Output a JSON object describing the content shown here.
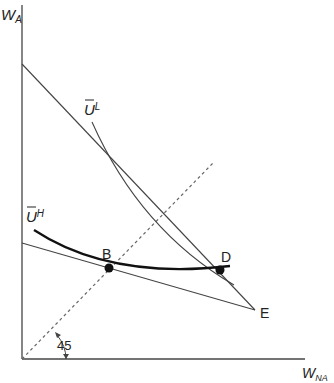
{
  "diagram": {
    "y_axis_label": {
      "main": "W",
      "sub": "A"
    },
    "x_axis_label": {
      "main": "W",
      "sub": "NA"
    },
    "angle_label": "45",
    "curve_labels": {
      "low": {
        "main": "U",
        "sup": "L"
      },
      "high": {
        "main": "U",
        "sup": "H"
      }
    },
    "points": [
      {
        "label": "B"
      },
      {
        "label": "D"
      },
      {
        "label": "E"
      }
    ],
    "colors": {
      "ink": "#222222",
      "line": "#444444",
      "dashed": "#666666"
    }
  }
}
